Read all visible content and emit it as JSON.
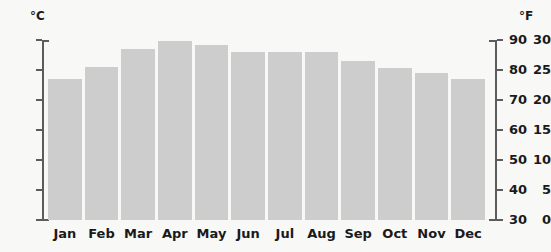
{
  "chart_data": {
    "type": "bar",
    "title": "",
    "xlabel": "",
    "ylabel": "°C",
    "categories": [
      "Jan",
      "Feb",
      "Mar",
      "Apr",
      "May",
      "Jun",
      "Jul",
      "Aug",
      "Sep",
      "Oct",
      "Nov",
      "Dec"
    ],
    "values": [
      23.5,
      25.5,
      28.5,
      29.8,
      29.2,
      28.0,
      28.0,
      28.0,
      26.5,
      25.3,
      24.5,
      23.5
    ],
    "series": [
      {
        "name": "Average monthly temperature",
        "values": [
          23.5,
          25.5,
          28.5,
          29.8,
          29.2,
          28.0,
          28.0,
          28.0,
          26.5,
          25.3,
          24.5,
          23.5
        ]
      }
    ],
    "ylim": [
      0,
      30
    ],
    "ylim_secondary": [
      30,
      90
    ],
    "grid": false,
    "legend": "none",
    "bar_color": "#cdcdcd",
    "background_color": "#f8f8f6",
    "axis_color": "#5c5c5c",
    "text_color": "#1a1a1a"
  },
  "axes": {
    "left": {
      "unit_label": "°C",
      "ticks": [
        {
          "value": 30,
          "label": "30"
        },
        {
          "value": 25,
          "label": "25"
        },
        {
          "value": 20,
          "label": "20"
        },
        {
          "value": 15,
          "label": "15"
        },
        {
          "value": 10,
          "label": "10"
        },
        {
          "value": 5,
          "label": "5"
        },
        {
          "value": 0,
          "label": "0"
        }
      ]
    },
    "right": {
      "unit_label": "°F",
      "ticks": [
        {
          "value": 90,
          "label": "90"
        },
        {
          "value": 80,
          "label": "80"
        },
        {
          "value": 70,
          "label": "70"
        },
        {
          "value": 60,
          "label": "60"
        },
        {
          "value": 50,
          "label": "50"
        },
        {
          "value": 40,
          "label": "40"
        },
        {
          "value": 30,
          "label": "30"
        }
      ]
    }
  }
}
